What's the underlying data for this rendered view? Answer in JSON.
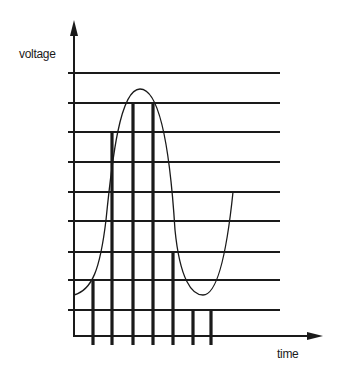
{
  "diagram": {
    "title": "",
    "y_axis_label": "voltage",
    "x_axis_label": "time",
    "colors": {
      "ink": "#1a1a1a",
      "background": "#ffffff"
    },
    "axes": {
      "origin": [
        74,
        336
      ],
      "y_axis_top": 20,
      "x_axis_right": 323
    },
    "quantization_levels_y": [
      73,
      103,
      132,
      162,
      192,
      221,
      252,
      280,
      310
    ],
    "level_line_x_range": [
      68,
      280
    ],
    "sample_bars": [
      {
        "x": 93,
        "top_y": 280
      },
      {
        "x": 112,
        "top_y": 132
      },
      {
        "x": 133,
        "top_y": 103
      },
      {
        "x": 153,
        "top_y": 103
      },
      {
        "x": 173,
        "top_y": 252
      },
      {
        "x": 193,
        "top_y": 310
      },
      {
        "x": 211,
        "top_y": 310
      }
    ],
    "tick_bottom_y": 345,
    "analog_curve_path": "M74,295 C92,290 100,270 106,220 C112,160 120,89 140,89 C160,89 170,150 175,230 C180,280 192,295 203,295 C216,295 226,260 233,192"
  }
}
